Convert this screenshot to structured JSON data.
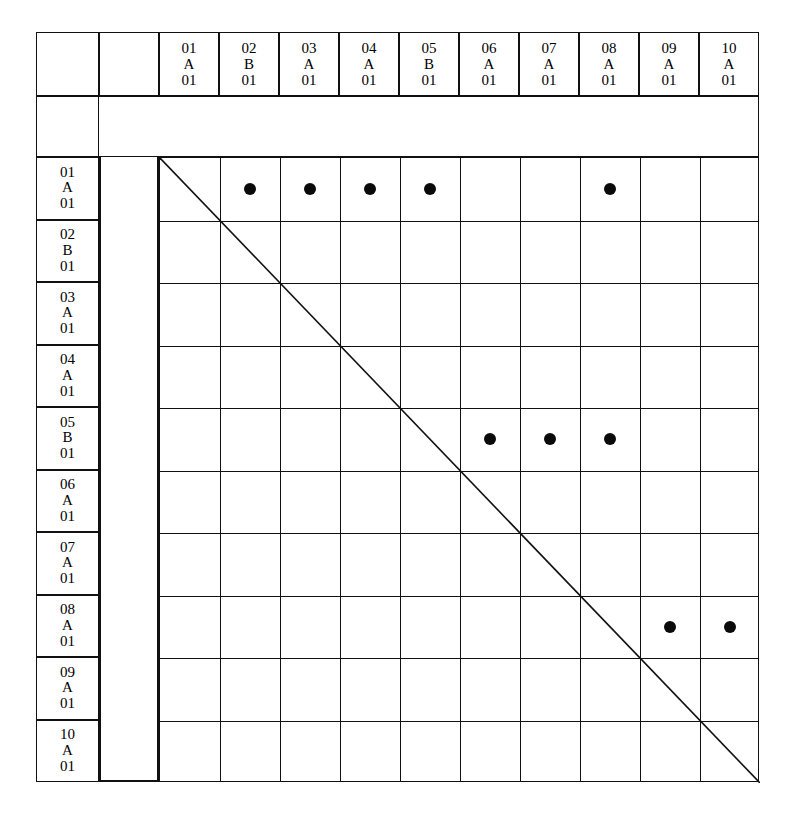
{
  "figure": {
    "type": "interaction-matrix"
  },
  "identifiers": {
    "column_headers": [
      {
        "line1": "01",
        "line2": "A",
        "line3": "01",
        "id": "01A01"
      },
      {
        "line1": "02",
        "line2": "B",
        "line3": "01",
        "id": "02B01"
      },
      {
        "line1": "03",
        "line2": "A",
        "line3": "01",
        "id": "03A01"
      },
      {
        "line1": "04",
        "line2": "A",
        "line3": "01",
        "id": "04A01"
      },
      {
        "line1": "05",
        "line2": "B",
        "line3": "01",
        "id": "05B01"
      },
      {
        "line1": "06",
        "line2": "A",
        "line3": "01",
        "id": "06A01"
      },
      {
        "line1": "07",
        "line2": "A",
        "line3": "01",
        "id": "07A01"
      },
      {
        "line1": "08",
        "line2": "A",
        "line3": "01",
        "id": "08A01"
      },
      {
        "line1": "09",
        "line2": "A",
        "line3": "01",
        "id": "09A01"
      },
      {
        "line1": "10",
        "line2": "A",
        "line3": "01",
        "id": "10A01"
      }
    ],
    "row_headers": [
      {
        "line1": "01",
        "line2": "A",
        "line3": "01",
        "id": "01A01"
      },
      {
        "line1": "02",
        "line2": "B",
        "line3": "01",
        "id": "02B01"
      },
      {
        "line1": "03",
        "line2": "A",
        "line3": "01",
        "id": "03A01"
      },
      {
        "line1": "04",
        "line2": "A",
        "line3": "01",
        "id": "04A01"
      },
      {
        "line1": "05",
        "line2": "B",
        "line3": "01",
        "id": "05B01"
      },
      {
        "line1": "06",
        "line2": "A",
        "line3": "01",
        "id": "06A01"
      },
      {
        "line1": "07",
        "line2": "A",
        "line3": "01",
        "id": "07A01"
      },
      {
        "line1": "08",
        "line2": "A",
        "line3": "01",
        "id": "08A01"
      },
      {
        "line1": "09",
        "line2": "A",
        "line3": "01",
        "id": "09A01"
      },
      {
        "line1": "10",
        "line2": "A",
        "line3": "01",
        "id": "10A01"
      }
    ]
  },
  "chart_data": {
    "type": "heatmap",
    "title": "",
    "xlabel": "",
    "ylabel": "",
    "categories": [
      "01A01",
      "02B01",
      "03A01",
      "04A01",
      "05B01",
      "06A01",
      "07A01",
      "08A01",
      "09A01",
      "10A01"
    ],
    "rows": [
      "01A01",
      "02B01",
      "03A01",
      "04A01",
      "05B01",
      "06A01",
      "07A01",
      "08A01",
      "09A01",
      "10A01"
    ],
    "grid": true,
    "legend": "none",
    "marker": "filled-circle",
    "diagonal_line": true,
    "values": [
      [
        0,
        1,
        1,
        1,
        1,
        0,
        0,
        1,
        0,
        0
      ],
      [
        0,
        0,
        0,
        0,
        0,
        0,
        0,
        0,
        0,
        0
      ],
      [
        0,
        0,
        0,
        0,
        0,
        0,
        0,
        0,
        0,
        0
      ],
      [
        0,
        0,
        0,
        0,
        0,
        0,
        0,
        0,
        0,
        0
      ],
      [
        0,
        0,
        0,
        0,
        0,
        1,
        1,
        1,
        0,
        0
      ],
      [
        0,
        0,
        0,
        0,
        0,
        0,
        0,
        0,
        0,
        0
      ],
      [
        0,
        0,
        0,
        0,
        0,
        0,
        0,
        0,
        0,
        0
      ],
      [
        0,
        0,
        0,
        0,
        0,
        0,
        0,
        0,
        1,
        1
      ],
      [
        0,
        0,
        0,
        0,
        0,
        0,
        0,
        0,
        0,
        0
      ],
      [
        0,
        0,
        0,
        0,
        0,
        0,
        0,
        0,
        0,
        0
      ]
    ],
    "marked_pairs": [
      {
        "row": "01A01",
        "col": "02B01"
      },
      {
        "row": "01A01",
        "col": "03A01"
      },
      {
        "row": "01A01",
        "col": "04A01"
      },
      {
        "row": "01A01",
        "col": "05B01"
      },
      {
        "row": "01A01",
        "col": "08A01"
      },
      {
        "row": "05B01",
        "col": "06A01"
      },
      {
        "row": "05B01",
        "col": "07A01"
      },
      {
        "row": "05B01",
        "col": "08A01"
      },
      {
        "row": "08A01",
        "col": "09A01"
      },
      {
        "row": "08A01",
        "col": "10A01"
      }
    ],
    "marked_count": 10
  },
  "colors": {
    "line": "#111111",
    "marker": "#0a0a0a",
    "background": "#ffffff"
  }
}
